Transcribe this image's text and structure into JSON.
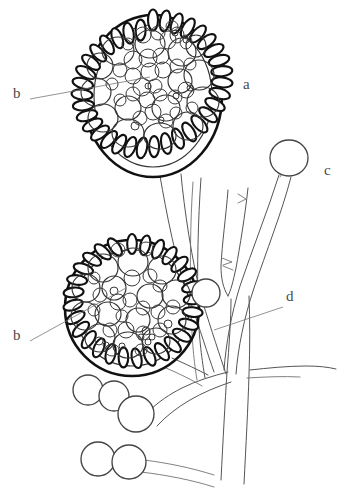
{
  "figure": {
    "background_color": "#ffffff",
    "ink_color": "#111111",
    "label_color": "#4a4a4a",
    "width": 346,
    "height": 495
  },
  "labels": [
    {
      "id": "label-b-upper",
      "text": "b",
      "x": 13,
      "y": 93,
      "leader": {
        "x1": 30,
        "y1": 99,
        "x2": 150,
        "y2": 77
      }
    },
    {
      "id": "label-a",
      "text": "a",
      "x": 243,
      "y": 84,
      "leader": null
    },
    {
      "id": "label-c",
      "text": "c",
      "x": 324,
      "y": 170,
      "leader": null
    },
    {
      "id": "label-d",
      "text": "d",
      "x": 286,
      "y": 296,
      "leader": {
        "x1": 283,
        "y1": 307,
        "x2": 214,
        "y2": 330
      }
    },
    {
      "id": "label-b-lower",
      "text": "b",
      "x": 13,
      "y": 335,
      "leader": {
        "x1": 30,
        "y1": 341,
        "x2": 126,
        "y2": 288
      }
    }
  ],
  "structures": {
    "sporangium_upper": {
      "name": "upper-sporangium",
      "center_x": 153,
      "center_y": 96,
      "radius_x": 69,
      "radius_y": 81,
      "wall_cell_count": 34,
      "spore_count": 44
    },
    "sporangium_lower": {
      "name": "lower-sporangium",
      "center_x": 132,
      "center_y": 308,
      "radius_x": 67,
      "radius_y": 68,
      "wall_cell_count": 30,
      "spore_count": 46
    },
    "sporangiole_c": {
      "name": "sporangiole-c",
      "center_x": 289,
      "center_y": 158,
      "radius": 19
    },
    "attached_spore_right": {
      "name": "attached-spore-right",
      "center_x": 206,
      "center_y": 293,
      "radius": 14
    },
    "detached_spores": [
      {
        "name": "detached-spore-1",
        "center_x": 88,
        "center_y": 390,
        "radius": 15
      },
      {
        "name": "detached-spore-2",
        "center_x": 114,
        "center_y": 396,
        "radius": 15
      },
      {
        "name": "detached-spore-3",
        "center_x": 136,
        "center_y": 414,
        "radius": 18
      },
      {
        "name": "detached-spore-4",
        "center_x": 98,
        "center_y": 459,
        "radius": 17
      },
      {
        "name": "detached-spore-5",
        "center_x": 129,
        "center_y": 462,
        "radius": 17
      }
    ]
  },
  "legend_keys": {
    "a": "sporangium",
    "b": "sporangiospores",
    "c": "sporangiole",
    "d": "sporangiophore"
  }
}
